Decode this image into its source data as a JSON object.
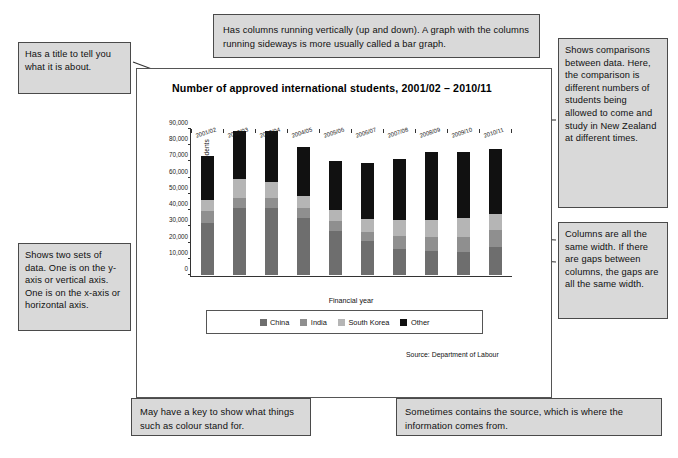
{
  "chart_data": {
    "type": "bar",
    "subtype": "stacked-column",
    "title": "Number of approved international students, 2001/02 – 2010/11",
    "xlabel": "Financial year",
    "ylabel": "Number of approved international students",
    "ylim": [
      0,
      90000
    ],
    "ytick_step": 10000,
    "ytick_labels": [
      "0",
      "10,000",
      "20,000",
      "30,000",
      "40,000",
      "50,000",
      "60,000",
      "70,000",
      "80,000",
      "90,000"
    ],
    "grid": false,
    "legend_position": "below-plot",
    "categories": [
      "2001/02",
      "2002/03",
      "2003/04",
      "2004/05",
      "2005/06",
      "2006/07",
      "2007/08",
      "2008/09",
      "2009/10",
      "2010/11"
    ],
    "series": [
      {
        "name": "China",
        "color": "#6e6e6e",
        "values": [
          32000,
          41500,
          41500,
          35000,
          27000,
          21000,
          16000,
          14500,
          14000,
          17000
        ]
      },
      {
        "name": "India",
        "color": "#8f8f8f",
        "values": [
          7500,
          6000,
          6000,
          6500,
          6000,
          5500,
          8000,
          9000,
          9500,
          10500
        ]
      },
      {
        "name": "South Korea",
        "color": "#b5b5b5",
        "values": [
          6500,
          11500,
          10000,
          7000,
          7000,
          8000,
          10000,
          10500,
          11500,
          10000
        ]
      },
      {
        "name": "Other",
        "color": "#111111",
        "values": [
          27500,
          30000,
          31500,
          30500,
          30500,
          34500,
          37500,
          42000,
          41000,
          40000
        ]
      }
    ],
    "totals": [
      73500,
      89000,
      89000,
      79000,
      70500,
      69000,
      71500,
      76000,
      76000,
      77500
    ],
    "source": "Source: Department of Labour"
  },
  "legend": {
    "items": [
      {
        "label": "China",
        "color": "#6e6e6e"
      },
      {
        "label": "India",
        "color": "#8f8f8f"
      },
      {
        "label": "South Korea",
        "color": "#b5b5b5"
      },
      {
        "label": "Other",
        "color": "#111111"
      }
    ]
  },
  "annotations": {
    "title_note": "Has a title to tell you what it is about.",
    "columns_note": "Has columns running vertically (up and down). A graph with the columns running sideways is more usually called a bar graph.",
    "compare_note": "Shows comparisons between data. Here, the comparison is different numbers of students being allowed to come and study in New Zealand at different times.",
    "width_note": "Columns are all the same width. If there are gaps between columns, the gaps are all the same width.",
    "axes_note": "Shows two sets of data. One is on the y-axis or vertical axis. One is on the x-axis or horizontal axis.",
    "key_note": "May have a key to show what things such as colour stand for.",
    "source_note": "Sometimes contains the source, which is where the information comes from."
  },
  "colors": {
    "callout_fill": "#d9d9d9",
    "callout_border": "#4a4a4a",
    "leader_line": "#333333"
  }
}
